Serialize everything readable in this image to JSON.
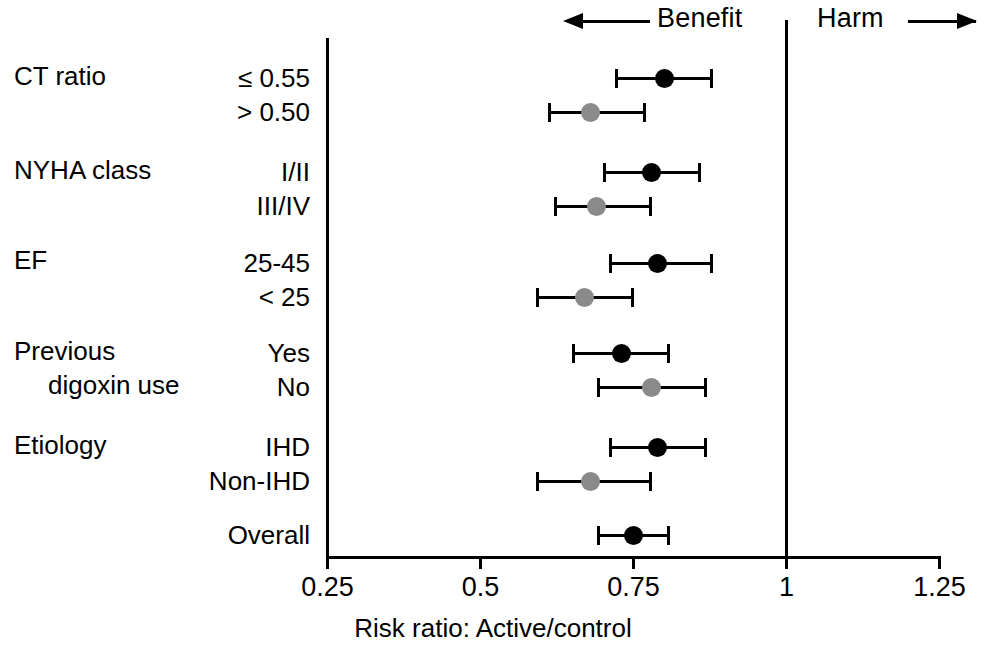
{
  "figure": {
    "axis_title": "Risk ratio:  Active/control",
    "benefit_label": "Benefit",
    "harm_label": "Harm",
    "tick_labels": [
      "0.25",
      "0.5",
      "0.75",
      "1",
      "1.25"
    ],
    "null_line_value": "1"
  },
  "chart_data": {
    "type": "scatter",
    "subtype": "forest-plot",
    "title": "",
    "xlabel": "Risk ratio:  Active/control",
    "ylabel": "",
    "xlim": [
      0.25,
      1.25
    ],
    "xticks": [
      0.25,
      0.5,
      0.75,
      1,
      1.25
    ],
    "xtick_labels": [
      "0.25",
      "0.5",
      "0.75",
      "1",
      "1.25"
    ],
    "grid": false,
    "legend": null,
    "reference_line": 1,
    "annotations": [
      {
        "text": "Benefit",
        "arrow": "left",
        "position": "top-left-of-null-line"
      },
      {
        "text": "Harm",
        "arrow": "right",
        "position": "top-right-of-null-line"
      }
    ],
    "marker_colors": {
      "primary": "#000000",
      "secondary": "#8a8a8a"
    },
    "groups": [
      {
        "name": "CT ratio",
        "rows": [
          {
            "label": "≤ 0.55",
            "estimate": 0.8,
            "ci_low": 0.72,
            "ci_high": 0.88,
            "color": "#000000"
          },
          {
            "label": "> 0.50",
            "estimate": 0.68,
            "ci_low": 0.61,
            "ci_high": 0.77,
            "color": "#8a8a8a"
          }
        ]
      },
      {
        "name": "NYHA class",
        "rows": [
          {
            "label": "I/II",
            "estimate": 0.78,
            "ci_low": 0.7,
            "ci_high": 0.86,
            "color": "#000000"
          },
          {
            "label": "III/IV",
            "estimate": 0.69,
            "ci_low": 0.62,
            "ci_high": 0.78,
            "color": "#8a8a8a"
          }
        ]
      },
      {
        "name": "EF",
        "rows": [
          {
            "label": "25-45",
            "estimate": 0.79,
            "ci_low": 0.71,
            "ci_high": 0.88,
            "color": "#000000"
          },
          {
            "label": "< 25",
            "estimate": 0.67,
            "ci_low": 0.59,
            "ci_high": 0.75,
            "color": "#8a8a8a"
          }
        ]
      },
      {
        "name": "Previous",
        "name2": "digoxin use",
        "rows": [
          {
            "label": "Yes",
            "estimate": 0.73,
            "ci_low": 0.65,
            "ci_high": 0.81,
            "color": "#000000"
          },
          {
            "label": "No",
            "estimate": 0.78,
            "ci_low": 0.69,
            "ci_high": 0.87,
            "color": "#8a8a8a"
          }
        ]
      },
      {
        "name": "Etiology",
        "rows": [
          {
            "label": "IHD",
            "estimate": 0.79,
            "ci_low": 0.71,
            "ci_high": 0.87,
            "color": "#000000"
          },
          {
            "label": "Non-IHD",
            "estimate": 0.68,
            "ci_low": 0.59,
            "ci_high": 0.78,
            "color": "#8a8a8a"
          }
        ]
      },
      {
        "name": "",
        "rows": [
          {
            "label": "Overall",
            "estimate": 0.75,
            "ci_low": 0.69,
            "ci_high": 0.81,
            "color": "#000000"
          }
        ]
      }
    ]
  },
  "layout": {
    "group_label_tops": [
      62,
      156,
      246,
      337,
      431
    ],
    "group_label_indent2_top": 371,
    "row_tops": [
      64,
      98,
      158,
      192,
      249,
      283,
      339,
      373,
      433,
      467,
      521
    ],
    "x0_px": 327.5,
    "px_per_unit": 612,
    "x_min": 0.25
  }
}
